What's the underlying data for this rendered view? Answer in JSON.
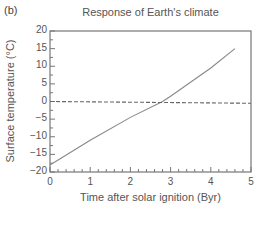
{
  "panel_label": "(b)",
  "chart_data": {
    "type": "line",
    "title": "Response of Earth's climate",
    "xlabel": "Time after solar ignition (Byr)",
    "ylabel": "Surface temperature (°C)",
    "xlim": [
      0,
      5
    ],
    "ylim": [
      -20,
      20
    ],
    "x_ticks": [
      "0",
      "1",
      "2",
      "3",
      "4",
      "5"
    ],
    "y_ticks": [
      "20",
      "15",
      "10",
      "5",
      "0",
      "−5",
      "−10",
      "−15",
      "−20"
    ],
    "grid": false,
    "legend": null,
    "series": [
      {
        "name": "Surface temperature (fixed albedo, no greenhouse feedback)",
        "style": "solid",
        "color": "#888888",
        "x": [
          0,
          1,
          2,
          2.8,
          3,
          4,
          4.6
        ],
        "y": [
          -18,
          -11,
          -4.5,
          0,
          1.5,
          9.5,
          15
        ]
      },
      {
        "name": "Freezing point (0 °C reference)",
        "style": "dashed",
        "color": "#666666",
        "x": [
          0,
          5
        ],
        "y": [
          0,
          -0.5
        ]
      }
    ]
  }
}
